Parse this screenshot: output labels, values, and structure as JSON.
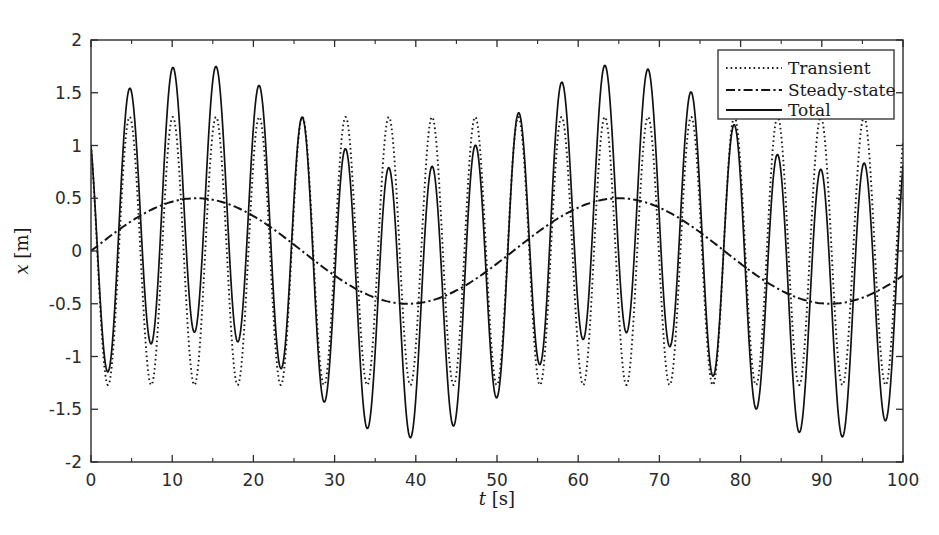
{
  "chart_data": {
    "type": "line",
    "title": "",
    "xlabel": "t [s]",
    "xlabel_symbol": "t",
    "xlabel_unit": "[s]",
    "ylabel": "x [m]",
    "ylabel_symbol": "x",
    "ylabel_unit": "[m]",
    "xlim": [
      0,
      100
    ],
    "ylim": [
      -2,
      2
    ],
    "xticks": [
      0,
      10,
      20,
      30,
      40,
      50,
      60,
      70,
      80,
      90,
      100
    ],
    "xticklabels": [
      "0",
      "10",
      "20",
      "30",
      "40",
      "50",
      "60",
      "70",
      "80",
      "90",
      "100"
    ],
    "xminorticks": [
      5,
      15,
      25,
      35,
      45,
      55,
      65,
      75,
      85,
      95
    ],
    "yticks": [
      -2,
      -1.5,
      -1,
      -0.5,
      0,
      0.5,
      1,
      1.5,
      2
    ],
    "yticklabels": [
      "-2",
      "-1.5",
      "-1",
      "-0.5",
      "0",
      "0.5",
      "1",
      "1.5",
      "2"
    ],
    "grid": false,
    "box": true,
    "ticks_direction": "in",
    "legend_position": "top-right",
    "legend_entries": [
      "Transient",
      "Steady-state",
      "Total"
    ],
    "series": [
      {
        "name": "Transient",
        "style": "dotted",
        "color": "#1b1b1b",
        "model": "amplitude_cosine",
        "amplitude": 1.27,
        "period": 5.32,
        "phase_deg": 38,
        "offset": 0,
        "peak_value": 1.27,
        "trough_value": -1.27,
        "value_at_t0": 1.0
      },
      {
        "name": "Steady-state",
        "style": "dash-dot",
        "color": "#141414",
        "model": "amplitude_sine",
        "amplitude": 0.5,
        "period": 52.0,
        "phase_deg": 0,
        "offset": 0,
        "peak_value": 0.5,
        "peak_time": 13,
        "trough_value": -0.5,
        "trough_time": 39,
        "value_at_t0": 0.0
      },
      {
        "name": "Total",
        "style": "solid",
        "color": "#111111",
        "model": "sum_of_transient_and_steady",
        "max_value": 1.75,
        "max_time": 14,
        "min_value": -1.78,
        "min_time": 40,
        "value_at_t0": 1.0
      }
    ]
  },
  "figure": {
    "background_color": "#ffffff",
    "axis_color": "#2b2b2b"
  }
}
